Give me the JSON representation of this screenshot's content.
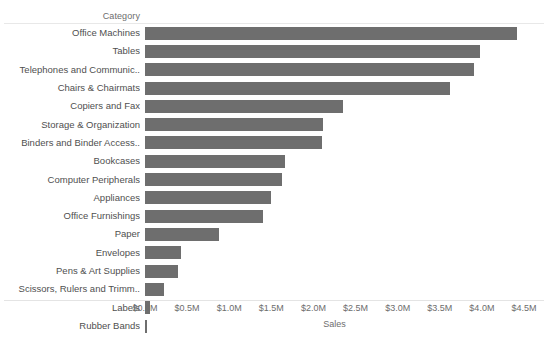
{
  "chart_data": {
    "type": "bar",
    "orientation": "horizontal",
    "title": "",
    "xlabel": "Sales",
    "ylabel": "Category",
    "categories": [
      "Office Machines",
      "Tables",
      "Telephones and Communic..",
      "Chairs & Chairmats",
      "Copiers and Fax",
      "Storage & Organization",
      "Binders and Binder Access..",
      "Bookcases",
      "Computer Peripherals",
      "Appliances",
      "Office Furnishings",
      "Paper",
      "Envelopes",
      "Pens & Art Supplies",
      "Scissors, Rulers and Trimm..",
      "Labels",
      "Rubber Bands"
    ],
    "values": [
      4.42,
      3.98,
      3.91,
      3.62,
      2.35,
      2.11,
      2.1,
      1.66,
      1.63,
      1.5,
      1.4,
      0.88,
      0.43,
      0.39,
      0.23,
      0.06,
      0.02
    ],
    "value_unit": "millions of dollars",
    "xlim": [
      0,
      4.5
    ],
    "xticks": [
      0,
      0.5,
      1.0,
      1.5,
      2.0,
      2.5,
      3.0,
      3.5,
      4.0,
      4.5
    ],
    "xtick_labels": [
      "$0.0M",
      "$0.5M",
      "$1.0M",
      "$1.5M",
      "$2.0M",
      "$2.5M",
      "$3.0M",
      "$3.5M",
      "$4.0M",
      "$4.5M"
    ],
    "grid": false,
    "legend": false,
    "bar_color": "#6e6e6e",
    "sort": "descending"
  },
  "axis": {
    "category_header": "Category",
    "sales_title": "Sales"
  },
  "colors": {
    "bar": "#6e6e6e",
    "text": "#4f4f4f",
    "axis_text": "#6d6d6d",
    "rule": "#e8e8e8",
    "background": "#ffffff"
  }
}
